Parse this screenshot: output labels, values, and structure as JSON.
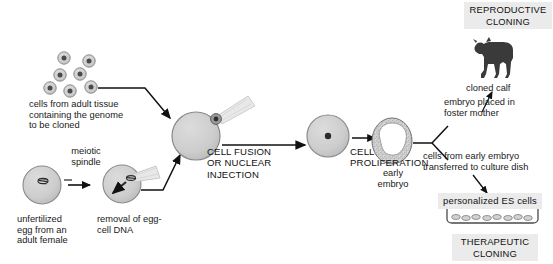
{
  "diagram": {
    "colors": {
      "cell_fill": "#cdcdcd",
      "cell_stroke": "#8a8a8a",
      "nucleus": "#4a4a4a",
      "pipette_fill": "#e2e2e2",
      "pipette_stroke": "#c0c0c0",
      "arrow": "#111111",
      "calf": "#3a3a3a",
      "box_bg": "#ebebeb",
      "background": "#ffffff",
      "text": "#1a1a1a"
    },
    "labels": {
      "adult_cells": "cells from adult tissue\ncontaining the genome\nto be cloned",
      "meiotic_spindle": "meiotic\nspindle",
      "unfertilized_egg": "unfertilized\negg from an\nadult female",
      "removal_dna": "removal of egg-\ncell DNA",
      "cell_fusion": "CELL FUSION\nOR NUCLEAR\nINJECTION",
      "cell_proliferation": "CELL\nPROLIFERATION",
      "early_embryo": "early\nembryo",
      "embryo_foster": "embryo placed in\nfoster mother",
      "cloned_calf": "cloned calf",
      "reproductive_cloning": "REPRODUCTIVE\nCLONING",
      "cells_transferred": "cells from early embryo\ntransferred to culture dish",
      "es_cells": "personalized ES cells",
      "therapeutic_cloning": "THERAPEUTIC\nCLONING"
    }
  }
}
